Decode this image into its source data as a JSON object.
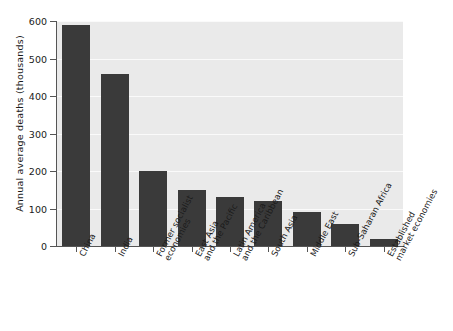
{
  "chart_data": {
    "type": "bar",
    "title": "",
    "xlabel": "",
    "ylabel": "Annual average deaths (thousands)",
    "ylim": [
      0,
      600
    ],
    "yticks": [
      0,
      100,
      200,
      300,
      400,
      500,
      600
    ],
    "ytick_labels": [
      "0",
      "100",
      "200",
      "300",
      "400",
      "500",
      "600"
    ],
    "grid": "horizontal",
    "legend": "none",
    "bar_color": "#3a3a3a",
    "plot_background": "#eaeaea",
    "gridline_color": "#fafafa",
    "axis_color": "#555555",
    "categories": [
      "China",
      "India",
      "Former socialist economies",
      "East Asia and the Pacific",
      "Latin America and the Caribbean",
      "South Asia",
      "Middle East",
      "Sub-Saharan Africa",
      "Established market economies"
    ],
    "category_lines": [
      [
        "China"
      ],
      [
        "India"
      ],
      [
        "Former socialist",
        "economies"
      ],
      [
        "East Asia",
        "and the Pacific"
      ],
      [
        "Latin America",
        "and the Caribbean"
      ],
      [
        "South Asia"
      ],
      [
        "Middle East"
      ],
      [
        "Sub-Saharan Africa"
      ],
      [
        "Established",
        "market economies"
      ]
    ],
    "values": [
      590,
      460,
      200,
      150,
      130,
      120,
      90,
      60,
      20
    ]
  }
}
